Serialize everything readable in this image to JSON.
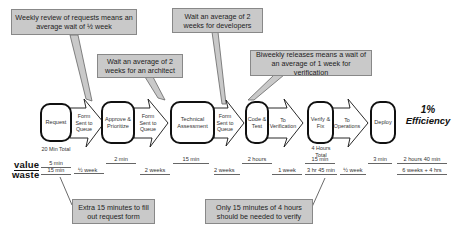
{
  "callouts": {
    "weekly_review": "Weekly review of requests means an average wait of ½ week",
    "architect": "Wait an average of 2 weeks for an architect",
    "developers": "Wait an average of 2 weeks for developers",
    "biweekly": "Biweekly releases means a wait of an average of 1 week for verification",
    "extra_form": "Extra 15 minutes to fill out request form",
    "verify_time": "Only 15 minutes of 4 hours should be needed to verify"
  },
  "processes": [
    {
      "label": "Request"
    },
    {
      "label": "Approve & Prioritize"
    },
    {
      "label": "Technical Assessment"
    },
    {
      "label": "Code & Test"
    },
    {
      "label": "Verify & Fix"
    },
    {
      "label": "Deploy"
    }
  ],
  "transitions": [
    {
      "label": "Form Sent to Queue"
    },
    {
      "label": "Form Sent to Queue"
    },
    {
      "label": "Form Sent to Queue"
    },
    {
      "label": "To Verification"
    },
    {
      "label": "To Operations"
    }
  ],
  "notes": {
    "request_total": "20 Min Total",
    "verify_total": "4 Hours Total"
  },
  "efficiency": {
    "percent": "1%",
    "label": "Efficiency"
  },
  "timeline": {
    "value_label": "value",
    "waste_label": "waste",
    "value": [
      {
        "text": "5 min"
      },
      {
        "text": "2 min"
      },
      {
        "text": "15 min"
      },
      {
        "text": "2 hours"
      },
      {
        "text": "15 min"
      },
      {
        "text": "3 min"
      },
      {
        "text": "2 hours 40 min"
      }
    ],
    "waste": [
      {
        "text": "15 min"
      },
      {
        "text": "½ week"
      },
      {
        "text": "2 weeks"
      },
      {
        "text": "2 weeks"
      },
      {
        "text": "1 week"
      },
      {
        "text": "3 hr 45 min"
      },
      {
        "text": "½ week"
      },
      {
        "text": "6 weeks + 4 hrs"
      }
    ]
  },
  "colors": {
    "callout_fill": "#c9c9c9",
    "callout_border": "#888888",
    "process_border": "#111111"
  }
}
